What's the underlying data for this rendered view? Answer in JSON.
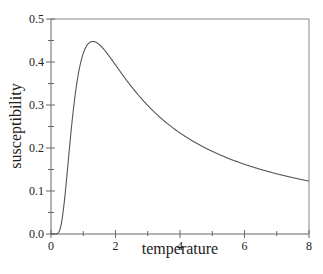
{
  "chart_data": {
    "type": "line",
    "title": "",
    "xlabel": "temperature",
    "ylabel": "susceptibility",
    "xlim": [
      0,
      8
    ],
    "ylim": [
      0,
      0.5
    ],
    "x_ticks": [
      0,
      2,
      4,
      6,
      8
    ],
    "x_tick_labels": [
      "0",
      "2",
      "4",
      "6",
      "8"
    ],
    "x_minor_ticks": [
      1,
      3,
      5,
      7
    ],
    "y_ticks": [
      0.0,
      0.1,
      0.2,
      0.3,
      0.4,
      0.5
    ],
    "y_tick_labels": [
      "0.0",
      "0.1",
      "0.2",
      "0.3",
      "0.4",
      "0.5"
    ],
    "y_minor_ticks": [
      0.05,
      0.15,
      0.25,
      0.35,
      0.45
    ],
    "grid": false,
    "legend": null,
    "series": [
      {
        "name": "susceptibility",
        "color": "#555555",
        "x": [
          0.0,
          0.2,
          0.3,
          0.4,
          0.5,
          0.6,
          0.7,
          0.8,
          0.9,
          1.0,
          1.1,
          1.2,
          1.3,
          1.4,
          1.6,
          1.8,
          2.0,
          2.5,
          3.0,
          3.5,
          4.0,
          4.5,
          5.0,
          5.5,
          6.0,
          6.5,
          7.0,
          7.5,
          8.0
        ],
        "values": [
          0.0,
          0.0002,
          0.0085,
          0.0386,
          0.0707,
          0.1417,
          0.2075,
          0.2688,
          0.3237,
          0.42,
          0.4343,
          0.4455,
          0.4475,
          0.4456,
          0.4366,
          0.4172,
          0.3932,
          0.3484,
          0.2993,
          0.2634,
          0.235,
          0.2122,
          0.1935,
          0.178,
          0.1647,
          0.1533,
          0.1434,
          0.1347,
          0.127
        ],
        "formula": "chi(T) = (1/T) * sech^2(1/T)"
      }
    ],
    "peak": {
      "x": 1.3,
      "y": 0.448
    }
  },
  "plot_area": {
    "left": 51,
    "top": 19,
    "right": 309,
    "bottom": 234
  }
}
